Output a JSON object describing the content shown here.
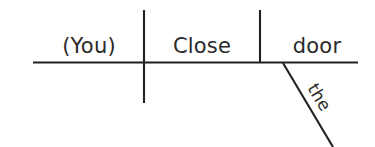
{
  "diagram": {
    "type": "reed-kellogg-sentence-diagram",
    "sentence": "(You) Close the door",
    "baseline": {
      "name": "main-baseline",
      "x1": 33,
      "y1": 62.5,
      "x2": 358,
      "y2": 62.5
    },
    "dividers": [
      {
        "name": "subject-verb-divider",
        "role": "subject-predicate separator",
        "x": 144,
        "y1": 10,
        "y2": 103,
        "crosses_baseline": true
      },
      {
        "name": "verb-object-divider",
        "role": "verb-direct-object separator",
        "x": 260,
        "y1": 10,
        "y2": 62.5,
        "crosses_baseline": false
      }
    ],
    "slant": {
      "name": "article-slant-line",
      "x1": 283,
      "y1": 63,
      "x2": 333,
      "y2": 147
    },
    "words": [
      {
        "id": "subject",
        "text": "(You)",
        "role": "subject (understood)",
        "x": 89,
        "baseline_y": 53,
        "anchor": "middle",
        "size": "main"
      },
      {
        "id": "verb",
        "text": "Close",
        "role": "verb",
        "x": 202,
        "baseline_y": 53,
        "anchor": "middle",
        "size": "main"
      },
      {
        "id": "object",
        "text": "door",
        "role": "direct object",
        "x": 317,
        "baseline_y": 53,
        "anchor": "middle",
        "size": "main"
      },
      {
        "id": "article",
        "text": "the",
        "role": "article modifier",
        "x": 307,
        "baseline_y": 88,
        "anchor": "start",
        "size": "modifier",
        "rotation_deg": 59
      }
    ],
    "colors": {
      "ink": "#212121",
      "text": "#2a2a2a",
      "background": "#ffffff"
    },
    "stroke_width": 2.1
  }
}
